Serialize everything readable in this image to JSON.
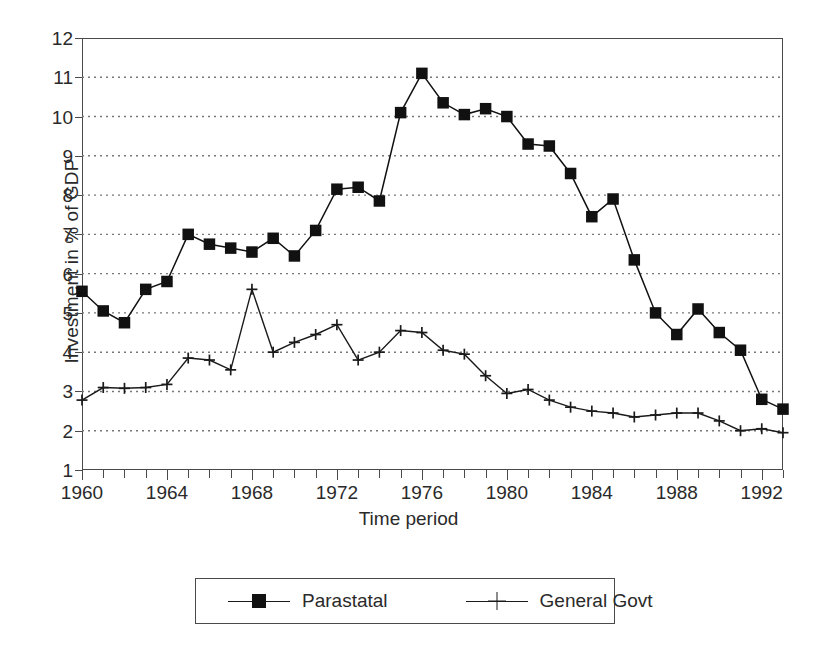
{
  "chart_data": {
    "type": "line",
    "title": "",
    "xlabel": "Time period",
    "ylabel": "Investment in % of GDP",
    "xlim": [
      1960,
      1993
    ],
    "ylim": [
      1,
      12
    ],
    "yticks": [
      1,
      2,
      3,
      4,
      5,
      6,
      7,
      8,
      9,
      10,
      11,
      12
    ],
    "xticks_labeled": [
      1960,
      1964,
      1968,
      1972,
      1976,
      1980,
      1984,
      1988,
      1992
    ],
    "xtick_interval": 1,
    "grid": "horizontal-dotted",
    "legend_position": "below-center",
    "x": [
      1960,
      1961,
      1962,
      1963,
      1964,
      1965,
      1966,
      1967,
      1968,
      1969,
      1970,
      1971,
      1972,
      1973,
      1974,
      1975,
      1976,
      1977,
      1978,
      1979,
      1980,
      1981,
      1982,
      1983,
      1984,
      1985,
      1986,
      1987,
      1988,
      1989,
      1990,
      1991,
      1992,
      1993
    ],
    "series": [
      {
        "name": "Parastatal",
        "marker": "filled-square",
        "values": [
          5.55,
          5.05,
          4.75,
          5.6,
          5.8,
          7.0,
          6.75,
          6.65,
          6.55,
          6.9,
          6.45,
          7.1,
          8.15,
          8.2,
          7.85,
          10.1,
          11.1,
          10.35,
          10.05,
          10.2,
          10.0,
          9.3,
          9.25,
          8.55,
          7.45,
          7.9,
          6.35,
          5.0,
          4.45,
          5.1,
          4.5,
          4.05,
          2.8,
          2.55
        ]
      },
      {
        "name": "General Govt",
        "marker": "plus",
        "values": [
          2.78,
          3.1,
          3.08,
          3.1,
          3.18,
          3.85,
          3.8,
          3.55,
          5.6,
          4.0,
          4.25,
          4.45,
          4.7,
          3.8,
          4.0,
          4.55,
          4.5,
          4.05,
          3.95,
          3.4,
          2.95,
          3.05,
          2.78,
          2.6,
          2.5,
          2.45,
          2.35,
          2.4,
          2.45,
          2.45,
          2.25,
          2.0,
          2.05,
          1.95
        ]
      }
    ]
  },
  "legend": {
    "items": [
      {
        "label": "Parastatal"
      },
      {
        "label": "General Govt"
      }
    ]
  },
  "colors": {
    "series_parastatal": "#111111",
    "series_general_govt": "#1a1a1a",
    "axis": "#4a4a4a",
    "grid": "#777777",
    "background": "#ffffff"
  }
}
